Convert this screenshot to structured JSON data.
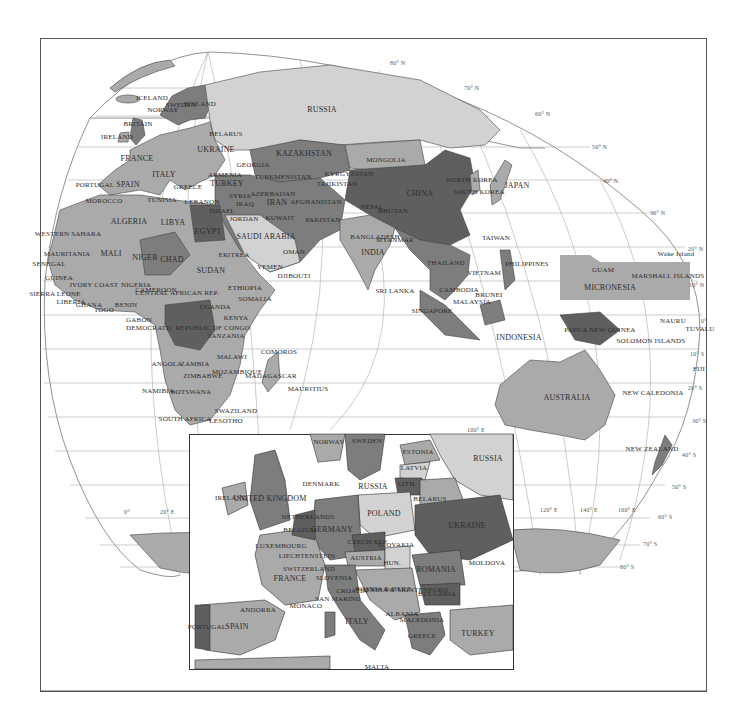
{
  "map": {
    "title": "",
    "colors": {
      "ocean": "#ffffff",
      "land_light": "#d2d2d2",
      "land_mid": "#aaaaaa",
      "land_dark": "#7d7d7d",
      "land_darker": "#5f5f5f",
      "border": "#333333",
      "grid": "#888888",
      "frame": "#555555"
    },
    "latitude_labels": [
      "80° N",
      "70° N",
      "60° N",
      "50° N",
      "40° N",
      "30° N",
      "20° N",
      "10° N",
      "0°",
      "10° S",
      "20° S",
      "30° S",
      "40° S",
      "50° S",
      "60° S",
      "70° S",
      "80° S"
    ],
    "longitude_labels": [
      "0°",
      "20° E",
      "100° E",
      "120° E",
      "140° E",
      "160° E"
    ],
    "country_labels": [
      {
        "name": "ICELAND",
        "x": 152,
        "y": 98
      },
      {
        "name": "NORWAY",
        "x": 163,
        "y": 110
      },
      {
        "name": "SWEDEN",
        "x": 181,
        "y": 105
      },
      {
        "name": "FINLAND",
        "x": 200,
        "y": 104
      },
      {
        "name": "BRITAIN",
        "x": 138,
        "y": 124
      },
      {
        "name": "IRELAND",
        "x": 117,
        "y": 137
      },
      {
        "name": "BELARUS",
        "x": 226,
        "y": 134
      },
      {
        "name": "RUSSIA",
        "x": 322,
        "y": 110
      },
      {
        "name": "UKRAINE",
        "x": 216,
        "y": 150
      },
      {
        "name": "FRANCE",
        "x": 137,
        "y": 159
      },
      {
        "name": "GEORGIA",
        "x": 253,
        "y": 165
      },
      {
        "name": "KAZAKHSTAN",
        "x": 304,
        "y": 154
      },
      {
        "name": "MONGOLIA",
        "x": 386,
        "y": 160
      },
      {
        "name": "ITALY",
        "x": 164,
        "y": 175
      },
      {
        "name": "ARMENIA",
        "x": 225,
        "y": 175
      },
      {
        "name": "TURKMENISTAN",
        "x": 283,
        "y": 177
      },
      {
        "name": "KYRGYZSTAN",
        "x": 349,
        "y": 174
      },
      {
        "name": "TAJIKISTAN",
        "x": 337,
        "y": 184
      },
      {
        "name": "PORTUGAL",
        "x": 95,
        "y": 185
      },
      {
        "name": "SPAIN",
        "x": 128,
        "y": 185
      },
      {
        "name": "GREECE",
        "x": 188,
        "y": 187
      },
      {
        "name": "TURKEY",
        "x": 227,
        "y": 184
      },
      {
        "name": "NORTH KOREA",
        "x": 472,
        "y": 180
      },
      {
        "name": "SOUTH KOREA",
        "x": 479,
        "y": 192
      },
      {
        "name": "JAPAN",
        "x": 517,
        "y": 186
      },
      {
        "name": "CHINA",
        "x": 420,
        "y": 194
      },
      {
        "name": "MOROCCO",
        "x": 104,
        "y": 201
      },
      {
        "name": "TUNISIA",
        "x": 162,
        "y": 200
      },
      {
        "name": "LEBANON",
        "x": 202,
        "y": 202
      },
      {
        "name": "AZERBAIJAN",
        "x": 273,
        "y": 194
      },
      {
        "name": "IRAN",
        "x": 277,
        "y": 203
      },
      {
        "name": "AFGHANISTAN",
        "x": 316,
        "y": 202
      },
      {
        "name": "SYRIA",
        "x": 240,
        "y": 196
      },
      {
        "name": "IRAQ",
        "x": 245,
        "y": 204
      },
      {
        "name": "ISRAEL",
        "x": 222,
        "y": 211
      },
      {
        "name": "NEPAL",
        "x": 372,
        "y": 207
      },
      {
        "name": "BHUTAN",
        "x": 393,
        "y": 211
      },
      {
        "name": "PAKISTAN",
        "x": 323,
        "y": 220
      },
      {
        "name": "ALGERIA",
        "x": 129,
        "y": 222
      },
      {
        "name": "LIBYA",
        "x": 173,
        "y": 223
      },
      {
        "name": "JORDAN",
        "x": 244,
        "y": 219
      },
      {
        "name": "KUWAIT",
        "x": 280,
        "y": 218
      },
      {
        "name": "EGYPT",
        "x": 208,
        "y": 232
      },
      {
        "name": "SAUDI ARABIA",
        "x": 266,
        "y": 237
      },
      {
        "name": "BANGLADESH",
        "x": 375,
        "y": 237
      },
      {
        "name": "MYANMAR",
        "x": 395,
        "y": 240
      },
      {
        "name": "TAIWAN",
        "x": 496,
        "y": 238
      },
      {
        "name": "WESTERN SAHARA",
        "x": 68,
        "y": 234
      },
      {
        "name": "OMAN",
        "x": 294,
        "y": 252
      },
      {
        "name": "INDIA",
        "x": 373,
        "y": 253
      },
      {
        "name": "MAURITANIA",
        "x": 67,
        "y": 254
      },
      {
        "name": "MALI",
        "x": 111,
        "y": 254
      },
      {
        "name": "NIGER",
        "x": 145,
        "y": 258
      },
      {
        "name": "CHAD",
        "x": 172,
        "y": 260
      },
      {
        "name": "ERITREA",
        "x": 234,
        "y": 255
      },
      {
        "name": "SUDAN",
        "x": 211,
        "y": 271
      },
      {
        "name": "YEMEN",
        "x": 270,
        "y": 267
      },
      {
        "name": "DJIBOUTI",
        "x": 294,
        "y": 276
      },
      {
        "name": "THAILAND",
        "x": 446,
        "y": 263
      },
      {
        "name": "VIETNAM",
        "x": 484,
        "y": 273
      },
      {
        "name": "PHILIPPINES",
        "x": 527,
        "y": 264
      },
      {
        "name": "GUAM",
        "x": 603,
        "y": 270
      },
      {
        "name": "Wake Island",
        "x": 676,
        "y": 254
      },
      {
        "name": "MARSHALL ISLANDS",
        "x": 668,
        "y": 276
      },
      {
        "name": "SENEGAL",
        "x": 49,
        "y": 264
      },
      {
        "name": "GUINEA",
        "x": 59,
        "y": 278
      },
      {
        "name": "IVORY COAST",
        "x": 94,
        "y": 285
      },
      {
        "name": "NIGERIA",
        "x": 136,
        "y": 285
      },
      {
        "name": "CAMEROON",
        "x": 156,
        "y": 290
      },
      {
        "name": "CENTRAL AFRICAN REP.",
        "x": 177,
        "y": 293
      },
      {
        "name": "ETHIOPIA",
        "x": 245,
        "y": 288
      },
      {
        "name": "SOMALIA",
        "x": 255,
        "y": 299
      },
      {
        "name": "SIERRA LEONE",
        "x": 55,
        "y": 294
      },
      {
        "name": "LIBERIA",
        "x": 71,
        "y": 302
      },
      {
        "name": "GHANA",
        "x": 89,
        "y": 305
      },
      {
        "name": "TOGO",
        "x": 104,
        "y": 310
      },
      {
        "name": "BENIN",
        "x": 126,
        "y": 305
      },
      {
        "name": "SRI LANKA",
        "x": 395,
        "y": 291
      },
      {
        "name": "CAMBODIA",
        "x": 459,
        "y": 290
      },
      {
        "name": "BRUNEI",
        "x": 489,
        "y": 295
      },
      {
        "name": "MALAYSIA",
        "x": 472,
        "y": 302
      },
      {
        "name": "MICRONESIA",
        "x": 610,
        "y": 288
      },
      {
        "name": "SINGAPORE",
        "x": 432,
        "y": 311
      },
      {
        "name": "GABON",
        "x": 139,
        "y": 320
      },
      {
        "name": "UGANDA",
        "x": 215,
        "y": 307
      },
      {
        "name": "KENYA",
        "x": 236,
        "y": 318
      },
      {
        "name": "NAURU",
        "x": 673,
        "y": 321
      },
      {
        "name": "TUVALU",
        "x": 700,
        "y": 329
      },
      {
        "name": "DEMOCRATIC REPUBLIC OF CONGO",
        "x": 188,
        "y": 328
      },
      {
        "name": "TANZANIA",
        "x": 226,
        "y": 336
      },
      {
        "name": "PAPUA NEW GUINEA",
        "x": 600,
        "y": 330
      },
      {
        "name": "INDONESIA",
        "x": 519,
        "y": 338
      },
      {
        "name": "SOLOMON ISLANDS",
        "x": 651,
        "y": 341
      },
      {
        "name": "COMOROS",
        "x": 279,
        "y": 352
      },
      {
        "name": "MALAWI",
        "x": 232,
        "y": 357
      },
      {
        "name": "ANGOLA",
        "x": 167,
        "y": 364
      },
      {
        "name": "ZAMBIA",
        "x": 195,
        "y": 364
      },
      {
        "name": "MOZAMBIQUE",
        "x": 237,
        "y": 372
      },
      {
        "name": "ZIMBABWE",
        "x": 203,
        "y": 376
      },
      {
        "name": "MADAGASCAR",
        "x": 271,
        "y": 376
      },
      {
        "name": "MAURITIUS",
        "x": 308,
        "y": 389
      },
      {
        "name": "NAMIBIA",
        "x": 158,
        "y": 391
      },
      {
        "name": "BOTSWANA",
        "x": 191,
        "y": 392
      },
      {
        "name": "FIJI",
        "x": 699,
        "y": 369
      },
      {
        "name": "NEW CALEDONIA",
        "x": 653,
        "y": 393
      },
      {
        "name": "AUSTRALIA",
        "x": 567,
        "y": 398
      },
      {
        "name": "SWAZILAND",
        "x": 236,
        "y": 411
      },
      {
        "name": "SOUTH AFRICA",
        "x": 185,
        "y": 419
      },
      {
        "name": "LESOTHO",
        "x": 226,
        "y": 421
      },
      {
        "name": "NEW ZEALAND",
        "x": 652,
        "y": 449
      }
    ],
    "inset": {
      "labels": [
        {
          "name": "NORWAY",
          "x": 329,
          "y": 442
        },
        {
          "name": "SWEDEN",
          "x": 367,
          "y": 441
        },
        {
          "name": "ESTONIA",
          "x": 418,
          "y": 452
        },
        {
          "name": "RUSSIA",
          "x": 488,
          "y": 459
        },
        {
          "name": "LATVIA",
          "x": 414,
          "y": 468
        },
        {
          "name": "DENMARK",
          "x": 321,
          "y": 484
        },
        {
          "name": "RUSSIA",
          "x": 373,
          "y": 487
        },
        {
          "name": "LITH.",
          "x": 407,
          "y": 484
        },
        {
          "name": "IRELAND",
          "x": 231,
          "y": 498
        },
        {
          "name": "UNITED KINGDOM",
          "x": 270,
          "y": 499
        },
        {
          "name": "BELARUS",
          "x": 430,
          "y": 499
        },
        {
          "name": "NETHERLANDS",
          "x": 308,
          "y": 517
        },
        {
          "name": "POLAND",
          "x": 384,
          "y": 514
        },
        {
          "name": "UKRAINE",
          "x": 467,
          "y": 526
        },
        {
          "name": "BELGIUM",
          "x": 300,
          "y": 530
        },
        {
          "name": "GERMANY",
          "x": 332,
          "y": 530
        },
        {
          "name": "CZECH REP.",
          "x": 368,
          "y": 542
        },
        {
          "name": "SLOVAKIA",
          "x": 396,
          "y": 545
        },
        {
          "name": "LUXEMBOURG",
          "x": 281,
          "y": 546
        },
        {
          "name": "LIECHTENSTEIN",
          "x": 307,
          "y": 556
        },
        {
          "name": "MOLDOVA",
          "x": 487,
          "y": 563
        },
        {
          "name": "AUSTRIA",
          "x": 366,
          "y": 558
        },
        {
          "name": "HUN.",
          "x": 392,
          "y": 563
        },
        {
          "name": "ROMANIA",
          "x": 436,
          "y": 570
        },
        {
          "name": "SWITZERLAND",
          "x": 309,
          "y": 569
        },
        {
          "name": "FRANCE",
          "x": 290,
          "y": 579
        },
        {
          "name": "SLOVENIA",
          "x": 334,
          "y": 578
        },
        {
          "name": "CROATIA",
          "x": 352,
          "y": 591
        },
        {
          "name": "BOSNIA & HERZ.",
          "x": 384,
          "y": 589
        },
        {
          "name": "SERBIA & MONTENEGRO",
          "x": 405,
          "y": 590
        },
        {
          "name": "BULGARIA",
          "x": 437,
          "y": 594
        },
        {
          "name": "SAN MARINO",
          "x": 338,
          "y": 599
        },
        {
          "name": "MONACO",
          "x": 306,
          "y": 606
        },
        {
          "name": "ANDORRA",
          "x": 258,
          "y": 610
        },
        {
          "name": "ALBANIA",
          "x": 402,
          "y": 614
        },
        {
          "name": "MACEDONIA",
          "x": 422,
          "y": 620
        },
        {
          "name": "ITALY",
          "x": 357,
          "y": 622
        },
        {
          "name": "PORTUGAL",
          "x": 207,
          "y": 627
        },
        {
          "name": "SPAIN",
          "x": 237,
          "y": 627
        },
        {
          "name": "TURKEY",
          "x": 478,
          "y": 634
        },
        {
          "name": "GREECE",
          "x": 422,
          "y": 636
        },
        {
          "name": "MALTA",
          "x": 377,
          "y": 667
        }
      ]
    }
  }
}
